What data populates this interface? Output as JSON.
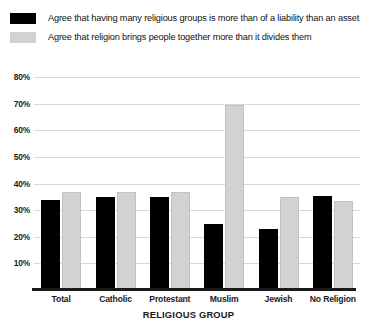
{
  "chart_data": {
    "type": "bar",
    "title": "",
    "xlabel": "RELIGIOUS GROUP",
    "ylabel": "",
    "ylim": [
      0,
      85
    ],
    "grid": true,
    "legend_position": "top-left",
    "categories": [
      "Total",
      "Catholic",
      "Protestant",
      "Muslim",
      "Jewish",
      "No Religion"
    ],
    "ytick_labels": [
      "10%",
      "20%",
      "30%",
      "40%",
      "50%",
      "60%",
      "70%",
      "80%"
    ],
    "ytick_values": [
      10,
      20,
      30,
      40,
      50,
      60,
      70,
      80
    ],
    "series": [
      {
        "name": "Agree that having many religious groups is more than of a liability than an asset",
        "color": "#000000",
        "values": [
          34,
          35,
          35,
          25,
          23,
          35.5
        ]
      },
      {
        "name": "Agree that religion brings people together more than it divides them",
        "color": "#d2d2d2",
        "values": [
          37,
          37,
          37,
          69.5,
          35,
          33.5
        ]
      }
    ]
  },
  "legend": {
    "items": [
      {
        "label": "Agree that having many religious groups is more than of a liability than an asset",
        "swatch": "series-a"
      },
      {
        "label": "Agree that religion brings people together more than it divides them",
        "swatch": "series-b"
      }
    ]
  },
  "axis": {
    "x_title": "RELIGIOUS GROUP"
  },
  "colors": {
    "series_a": "#000000",
    "series_b": "#d2d2d2",
    "gridline": "#d8d8d8",
    "axis": "#1a1a1a",
    "background": "#ffffff"
  }
}
